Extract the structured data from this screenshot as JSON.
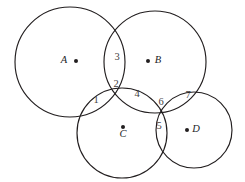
{
  "figure": {
    "width": 245,
    "height": 182,
    "background_color": "#ffffff",
    "stroke_color": "#221e1f",
    "number_color": "#45413f"
  },
  "sets": [
    {
      "key": "A",
      "label": "A",
      "cx": 70,
      "cy": 62,
      "r": 55,
      "label_x": 64,
      "label_y": 61,
      "dot_x": 76,
      "dot_y": 61,
      "dot_r": 2.0
    },
    {
      "key": "B",
      "label": "B",
      "cx": 155,
      "cy": 62,
      "r": 51,
      "label_x": 158,
      "label_y": 61,
      "dot_x": 148,
      "dot_y": 61,
      "dot_r": 2.0
    },
    {
      "key": "C",
      "label": "C",
      "cx": 122,
      "cy": 133,
      "r": 45,
      "label_x": 123,
      "label_y": 135,
      "dot_x": 123,
      "dot_y": 127,
      "dot_r": 2.0
    },
    {
      "key": "D",
      "label": "D",
      "cx": 194,
      "cy": 130,
      "r": 38,
      "label_x": 196,
      "label_y": 130,
      "dot_x": 187,
      "dot_y": 130,
      "dot_r": 2.0
    }
  ],
  "regions": [
    {
      "id": "region-1",
      "label": "1",
      "x": 96,
      "y": 101
    },
    {
      "id": "region-2",
      "label": "2",
      "x": 116,
      "y": 85
    },
    {
      "id": "region-3",
      "label": "3",
      "x": 117,
      "y": 58
    },
    {
      "id": "region-4",
      "label": "4",
      "x": 137,
      "y": 95
    },
    {
      "id": "region-5",
      "label": "5",
      "x": 159,
      "y": 127
    },
    {
      "id": "region-6",
      "label": "6",
      "x": 161,
      "y": 103
    },
    {
      "id": "region-7",
      "label": "7",
      "x": 188,
      "y": 96
    }
  ]
}
